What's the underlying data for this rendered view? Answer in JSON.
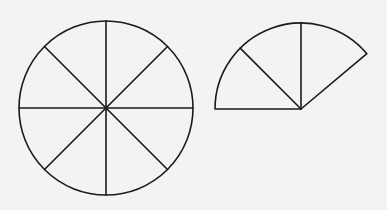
{
  "figure": {
    "background": "#f3f3f1",
    "stroke_color": "#1a1a1a",
    "full_circle": {
      "cx": 106,
      "cy": 108,
      "r": 87,
      "divisions": 8,
      "description": "Circle divided into 8 equal sectors"
    },
    "partial_sector": {
      "cx": 301,
      "cy": 109,
      "r": 86,
      "start_angle_deg": 40,
      "end_angle_deg": 180,
      "inner_radii_deg": [
        90,
        135
      ],
      "description": "Sector composed of three circle slices"
    }
  }
}
